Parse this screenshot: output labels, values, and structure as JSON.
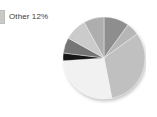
{
  "widget": {
    "title": "Pie chart with legend",
    "background_color": "#ffffff"
  },
  "legend": {
    "position": "top-left",
    "items": [
      {
        "label": "Other 12%",
        "name": "Other",
        "value_text": "12%",
        "value": 12,
        "swatch_color": "#c9c9c9",
        "clipped": true
      }
    ]
  },
  "chart_data": {
    "type": "pie",
    "title": "",
    "xlabel": "",
    "ylabel": "",
    "grid": false,
    "legend_position": "top-left",
    "start_angle_deg": 0,
    "direction": "clockwise",
    "center": {
      "x": 42,
      "y": 46
    },
    "radius": 41,
    "has_shadow": true,
    "shadow_color": "#d9d9d9",
    "labels": [
      "Other"
    ],
    "slices": [
      {
        "label": "Slice 1",
        "value": 10,
        "percent": 10,
        "color": "#8e8e8e",
        "start_deg": 0,
        "end_deg": 36
      },
      {
        "label": "Slice 2",
        "value": 5,
        "percent": 5,
        "color": "#b6b6b6",
        "start_deg": 36,
        "end_deg": 54
      },
      {
        "label": "Slice 3",
        "value": 32,
        "percent": 32,
        "color": "#c0c0c0",
        "start_deg": 54,
        "end_deg": 169
      },
      {
        "label": "Slice 4",
        "value": 27,
        "percent": 27,
        "color": "#f1f1f1",
        "start_deg": 169,
        "end_deg": 266
      },
      {
        "label": "Slice 5",
        "value": 3,
        "percent": 3,
        "color": "#121212",
        "start_deg": 266,
        "end_deg": 277
      },
      {
        "label": "Slice 6",
        "value": 6,
        "percent": 6,
        "color": "#757575",
        "start_deg": 277,
        "end_deg": 299
      },
      {
        "label": "Slice 7",
        "value": 9,
        "percent": 9,
        "color": "#cbcbcb",
        "start_deg": 299,
        "end_deg": 331
      },
      {
        "label": "Other",
        "value": 8,
        "percent": 8,
        "color": "#aeaeae",
        "start_deg": 331,
        "end_deg": 360
      }
    ],
    "values": [
      10,
      5,
      32,
      27,
      3,
      6,
      9,
      8
    ],
    "categories": [
      "Slice 1",
      "Slice 2",
      "Slice 3",
      "Slice 4",
      "Slice 5",
      "Slice 6",
      "Slice 7",
      "Other"
    ]
  }
}
